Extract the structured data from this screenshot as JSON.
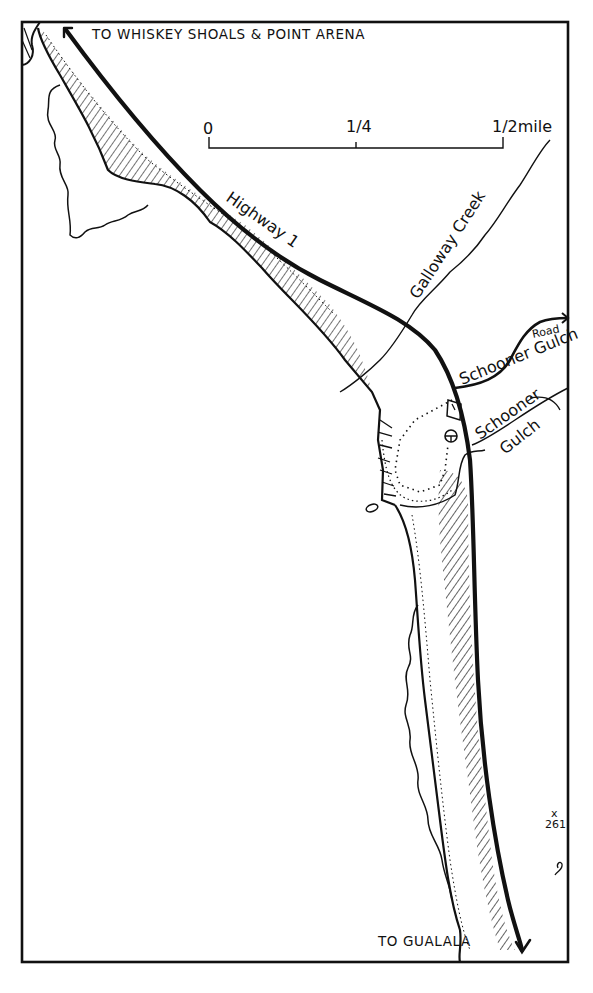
{
  "map": {
    "title_north": "TO WHISKEY SHOALS & POINT ARENA",
    "title_south": "TO GUALALA",
    "scale_bar": {
      "ticks": [
        "0",
        "1/4",
        "1/2mile"
      ],
      "tick_0": "0",
      "tick_quarter": "1/4",
      "tick_half": "1/2mile"
    },
    "labels": {
      "highway": "Highway 1",
      "creek": "Galloway Creek",
      "road_line1": "Schooner Gulch",
      "road_line2": "Road",
      "gulch_line1": "Schooner",
      "gulch_line2": "Gulch",
      "elevation_mark": "x",
      "elevation_value": "261"
    },
    "icons": {
      "north_arrow": "arrow-up-left-icon",
      "south_arrow": "arrow-down-icon",
      "parking": "parking-icon",
      "trailhead": "circle-cross-icon"
    },
    "colors": {
      "ink": "#111111",
      "paper": "#ffffff"
    }
  }
}
